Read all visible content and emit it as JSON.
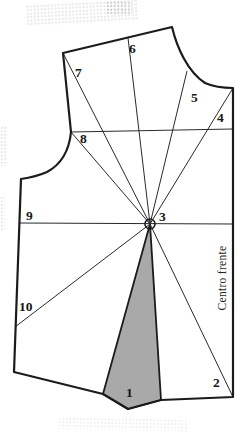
{
  "diagram": {
    "numbers": [
      "1",
      "2",
      "3",
      "4",
      "5",
      "6",
      "7",
      "8",
      "9",
      "10"
    ],
    "center_front_label": "Centro frente",
    "colors": {
      "outline": "#1b1b1b",
      "slash_line": "#2a2a2a",
      "dart_fill": "#a9a9a9",
      "paper": "#ffffff"
    }
  }
}
